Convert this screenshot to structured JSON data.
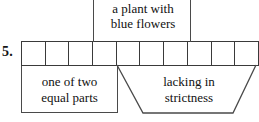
{
  "puzzle": {
    "number_label": "5.",
    "grid": {
      "cell_count": 11,
      "cells": [
        "",
        "",
        "",
        "",
        "",
        "",
        "",
        "",
        "",
        "",
        ""
      ],
      "border_color": "#3a3a3a",
      "fill_color": "#ffffff"
    },
    "clues": [
      {
        "id": "clue-top",
        "text": "a plant with\nblue flowers",
        "shape": "open-box",
        "position": "above-grid"
      },
      {
        "id": "clue-left",
        "text": "one of two\nequal parts",
        "shape": "rectangle",
        "position": "below-grid-left"
      },
      {
        "id": "clue-right",
        "text": "lacking in\nstrictness",
        "shape": "trapezoid",
        "position": "below-grid-right"
      }
    ],
    "line_color": "#4a4a4a",
    "text_color": "#111111",
    "background": "#ffffff"
  }
}
